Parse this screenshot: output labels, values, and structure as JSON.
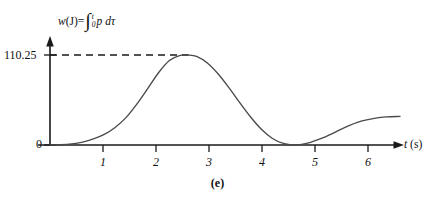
{
  "figure": {
    "caption": "(e)",
    "background_color": "#ffffff",
    "curve_color": "#4a4a4a",
    "axis_color": "#1a1a1a"
  },
  "axes": {
    "y_label_parts": {
      "variable": "w",
      "unit": "(J)",
      "equals": "=",
      "integral_glyph": "∫",
      "limit_upper": "t",
      "limit_lower": "0",
      "integrand": "p",
      "differential": "dτ"
    },
    "y_label_full": "w (J) = ∫₀ᵗ p dτ",
    "x_label_variable": "t",
    "x_label_unit": "(s)",
    "y_ticks": [
      {
        "value": 110.25,
        "label": "110.25"
      },
      {
        "value": 0,
        "label": "0"
      }
    ],
    "x_ticks": [
      {
        "value": 1,
        "label": "1"
      },
      {
        "value": 2,
        "label": "2"
      },
      {
        "value": 3,
        "label": "3"
      },
      {
        "value": 4,
        "label": "4"
      },
      {
        "value": 5,
        "label": "5"
      },
      {
        "value": 6,
        "label": "6"
      }
    ]
  },
  "annotations": {
    "peak_guide": {
      "style": "dashed",
      "y_value": 110.25,
      "from_x": 0,
      "to_x": 2.55,
      "label": "110.25"
    }
  },
  "chart_data": {
    "type": "line",
    "title": "",
    "subtitle": "",
    "xlabel": "t (s)",
    "ylabel": "w (J) = ∫₀ᵗ p dτ",
    "xlim": [
      0,
      6.45
    ],
    "ylim": [
      0,
      122
    ],
    "grid": false,
    "legend": null,
    "series": [
      {
        "name": "w(t)",
        "x": [
          0.0,
          0.2,
          0.4,
          0.6,
          0.8,
          1.0,
          1.2,
          1.4,
          1.6,
          1.8,
          2.0,
          2.2,
          2.4,
          2.55,
          2.7,
          2.9,
          3.1,
          3.3,
          3.5,
          3.7,
          3.9,
          4.1,
          4.3,
          4.55,
          4.75,
          5.0,
          5.25,
          5.5,
          5.75,
          6.0,
          6.2,
          6.45
        ],
        "y": [
          0.0,
          0.3,
          1.4,
          3.6,
          7.4,
          13.0,
          21.5,
          33.5,
          50.0,
          69.0,
          88.5,
          103.5,
          109.8,
          110.25,
          108.5,
          100.5,
          87.0,
          70.0,
          51.5,
          34.0,
          19.0,
          8.0,
          2.0,
          0.0,
          2.2,
          8.0,
          15.5,
          23.5,
          29.5,
          33.0,
          34.5,
          35.0
        ]
      }
    ],
    "annotations": [
      {
        "type": "hline_segment",
        "y": 110.25,
        "x_start": 0,
        "x_end": 2.55,
        "style": "dashed",
        "label": "110.25"
      }
    ],
    "key_points": {
      "peak": {
        "x": 2.55,
        "y": 110.25
      },
      "zero_touch": {
        "x": 4.55,
        "y": 0
      },
      "plateau": {
        "x": 6.45,
        "y": 35
      },
      "start": {
        "x": 0,
        "y": 0
      }
    }
  }
}
